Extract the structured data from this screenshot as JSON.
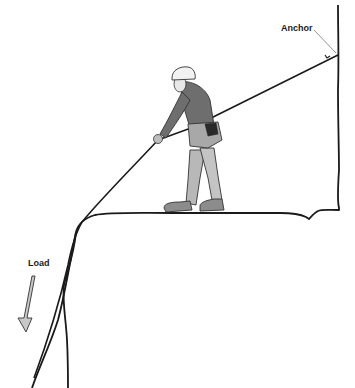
{
  "diagram": {
    "labels": {
      "anchor": "Anchor",
      "load": "Load"
    },
    "colors": {
      "line": "#1a1a1a",
      "clothing_dark": "#6e6e6e",
      "clothing_mid": "#9a9a9a",
      "clothing_light": "#c4c4c4",
      "helmet": "#f2f2f2",
      "arrow_fill": "#c8c8c8",
      "background": "#ffffff"
    }
  }
}
